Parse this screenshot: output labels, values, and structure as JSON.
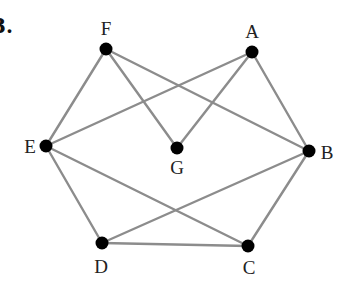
{
  "problem_number": "3.",
  "graph": {
    "edge_color": "#8c8c8c",
    "node_color": "#000000",
    "nodes": [
      {
        "id": "F",
        "label": "F",
        "x": 106,
        "y": 49,
        "lx": 106,
        "ly": 28
      },
      {
        "id": "A",
        "label": "A",
        "x": 252,
        "y": 52,
        "lx": 252,
        "ly": 31
      },
      {
        "id": "E",
        "label": "E",
        "x": 46,
        "y": 146,
        "lx": 30,
        "ly": 146
      },
      {
        "id": "G",
        "label": "G",
        "x": 177,
        "y": 148,
        "lx": 177,
        "ly": 167
      },
      {
        "id": "B",
        "label": "B",
        "x": 309,
        "y": 151,
        "lx": 327,
        "ly": 152
      },
      {
        "id": "D",
        "label": "D",
        "x": 102,
        "y": 243,
        "lx": 101,
        "ly": 266
      },
      {
        "id": "C",
        "label": "C",
        "x": 248,
        "y": 246,
        "lx": 249,
        "ly": 267
      }
    ],
    "edges": [
      [
        "F",
        "E"
      ],
      [
        "F",
        "G"
      ],
      [
        "F",
        "B"
      ],
      [
        "A",
        "E"
      ],
      [
        "A",
        "G"
      ],
      [
        "A",
        "B"
      ],
      [
        "E",
        "D"
      ],
      [
        "E",
        "C"
      ],
      [
        "B",
        "D"
      ],
      [
        "B",
        "C"
      ],
      [
        "D",
        "C"
      ]
    ]
  }
}
